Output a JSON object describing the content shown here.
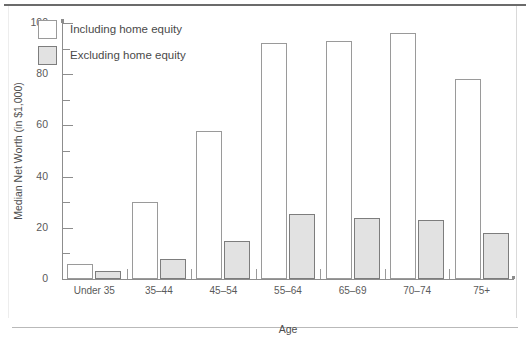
{
  "chart_data": {
    "type": "bar",
    "title": "",
    "xlabel": "Age",
    "ylabel": "Median Net Worth (in $1,000)",
    "categories": [
      "Under 35",
      "35–44",
      "45–54",
      "55–64",
      "65–69",
      "70–74",
      "75+"
    ],
    "series": [
      {
        "name": "Including home equity",
        "color": "#ffffff",
        "values": [
          6,
          30,
          58,
          92,
          93,
          96,
          78
        ]
      },
      {
        "name": "Excluding home equity",
        "color": "#e2e2e2",
        "values": [
          3,
          8,
          15,
          25.5,
          24,
          23,
          18
        ]
      }
    ],
    "ylim": [
      0,
      100
    ],
    "yticks_major": [
      0,
      20,
      40,
      60,
      80,
      100
    ],
    "yticks_minor": [
      10,
      30,
      50,
      70,
      90
    ],
    "ytick_labels": [
      "0",
      "20",
      "40",
      "60",
      "80",
      "100"
    ],
    "grid": false,
    "legend_position": "upper-left-inside"
  }
}
